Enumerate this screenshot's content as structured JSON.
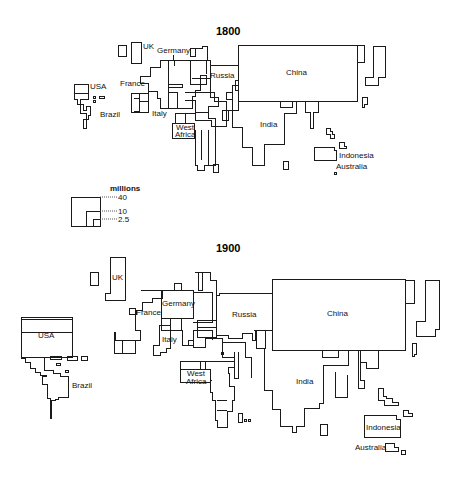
{
  "maps": [
    {
      "title": "1800",
      "labels": {
        "uk": "UK",
        "germany": "Germany",
        "usa": "USA",
        "france": "France",
        "russia": "Russia",
        "china": "China",
        "brazil": "Brazil",
        "italy": "Italy",
        "west_africa_1": "West",
        "west_africa_2": "Africa",
        "india": "India",
        "indonesia": "Indonesia",
        "australia": "Australia"
      }
    },
    {
      "title": "1900",
      "labels": {
        "uk": "UK",
        "germany": "Germany",
        "usa": "USA",
        "france": "France",
        "russia": "Russia",
        "china": "China",
        "brazil": "Brazil",
        "italy": "Italy",
        "west_africa_1": "West",
        "west_africa_2": "Africa",
        "india": "India",
        "indonesia": "Indonesia",
        "australia": "Australia"
      }
    }
  ],
  "legend": {
    "title": "millions",
    "values": [
      "40",
      "10",
      "2.5"
    ]
  }
}
